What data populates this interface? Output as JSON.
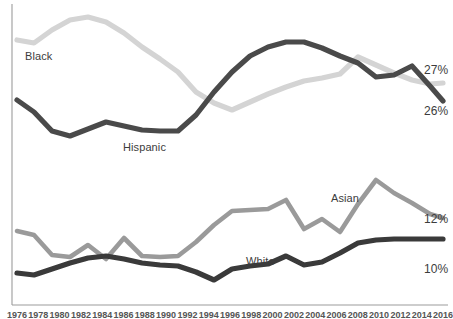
{
  "chart_data": {
    "type": "line",
    "title": "",
    "subtitle": "",
    "xlabel": "",
    "ylabel": "",
    "grid": false,
    "legend_position": "inline-series-labels",
    "xlim": [
      1976,
      2016
    ],
    "ylim": [
      0,
      32
    ],
    "x": [
      1976,
      1978,
      1980,
      1982,
      1984,
      1986,
      1988,
      1990,
      1992,
      1994,
      1996,
      1998,
      2000,
      2002,
      2004,
      2006,
      2008,
      2010,
      2012,
      2014,
      2016
    ],
    "xtick_labels": [
      "1976",
      "1978",
      "1980",
      "1982",
      "1984",
      "1986",
      "1988",
      "1990",
      "1992",
      "1994",
      "1996",
      "1998",
      "2000",
      "2002",
      "2004",
      "2006",
      "2008",
      "2010",
      "2012",
      "2014",
      "2016"
    ],
    "series": [
      {
        "name": "Black",
        "color": "#d4d4d4",
        "inline_label": "Black",
        "end_label": "27%",
        "values": [
          28.5,
          27.9,
          29.4,
          30.6,
          30.9,
          30.3,
          28.7,
          27.4,
          26.2,
          24.9,
          23.1,
          22.3,
          21.6,
          22.4,
          23.2,
          23.9,
          24.7,
          25.1,
          25.6,
          27.6,
          27.0
        ]
      },
      {
        "name": "Hispanic",
        "color": "#4a4a4a",
        "inline_label": "Hispanic",
        "end_label": "26%",
        "values": [
          23.6,
          22.5,
          21.3,
          21.9,
          22.5,
          23.1,
          22.6,
          22.3,
          22.4,
          23.5,
          25.6,
          27.1,
          28.3,
          29.2,
          29.4,
          28.8,
          27.8,
          26.3,
          26.9,
          27.5,
          26.0
        ]
      },
      {
        "name": "Asian",
        "color": "#9a9a9a",
        "inline_label": "Asian",
        "end_label": "12%",
        "values": [
          9.6,
          9.2,
          8.4,
          8.5,
          9.2,
          8.6,
          9.8,
          8.9,
          8.8,
          8.9,
          10.0,
          11.2,
          11.8,
          11.9,
          12.0,
          12.6,
          10.8,
          11.4,
          10.5,
          13.4,
          12.0
        ]
      },
      {
        "name": "White",
        "color": "#3a3a3a",
        "inline_label": "White",
        "end_label": "10%",
        "values": [
          7.3,
          7.2,
          7.6,
          8.0,
          8.3,
          8.5,
          8.3,
          8.0,
          7.9,
          7.8,
          7.5,
          7.1,
          7.6,
          7.8,
          7.9,
          8.3,
          7.8,
          8.1,
          8.8,
          9.8,
          10.0
        ]
      }
    ],
    "end_labels": [
      {
        "text": "27%",
        "series": "Black"
      },
      {
        "text": "26%",
        "series": "Hispanic"
      },
      {
        "text": "12%",
        "series": "Asian"
      },
      {
        "text": "10%",
        "series": "White"
      }
    ],
    "axis_color": "#9c9c9c"
  }
}
